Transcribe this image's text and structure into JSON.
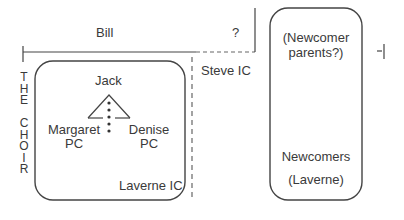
{
  "diagram": {
    "top_labels": {
      "left": "Bill",
      "right": "?"
    },
    "side_label": [
      "T",
      "H",
      "E",
      "",
      "C",
      "H",
      "O",
      "I",
      "R"
    ],
    "choir_box": {
      "top": "Jack",
      "left_name": "Margaret",
      "left_role": "PC",
      "right_name": "Denise",
      "right_role": "PC",
      "bottom_right": "Laverne IC"
    },
    "middle_label": "Steve IC",
    "newcomer_box": {
      "top_line1": "(Newcomer",
      "top_line2": "parents?)",
      "bottom_line1": "Newcomers",
      "bottom_line2": "(Laverne)"
    },
    "colors": {
      "line": "#444444",
      "dashed": "#666666"
    }
  }
}
